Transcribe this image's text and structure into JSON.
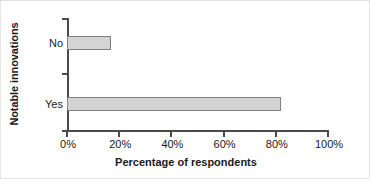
{
  "chart_data": {
    "type": "bar",
    "orientation": "horizontal",
    "title": "",
    "xlabel": "Percentage of respondents",
    "ylabel": "Notable innovations",
    "categories": [
      "Yes",
      "No"
    ],
    "values": [
      82,
      17
    ],
    "display_order_top_to_bottom": [
      "No",
      "Yes"
    ],
    "xlim": [
      0,
      100
    ],
    "xticks": [
      0,
      20,
      40,
      60,
      80,
      100
    ],
    "xticklabels": [
      "0%",
      "20%",
      "40%",
      "60%",
      "80%",
      "100%"
    ],
    "grid": false,
    "legend": false,
    "bar_fill_color": "#d4d4d4",
    "bar_edge_color": "#808080",
    "axis_color": "#4a4a4a",
    "text_color": "#1a1a1a",
    "background_color": "#ffffff"
  },
  "axes": {
    "y_title": "Notable innovations",
    "x_title": "Percentage of respondents",
    "category_no": "No",
    "category_yes": "Yes",
    "tick_0": "0%",
    "tick_20": "20%",
    "tick_40": "40%",
    "tick_60": "60%",
    "tick_80": "80%",
    "tick_100": "100%"
  }
}
